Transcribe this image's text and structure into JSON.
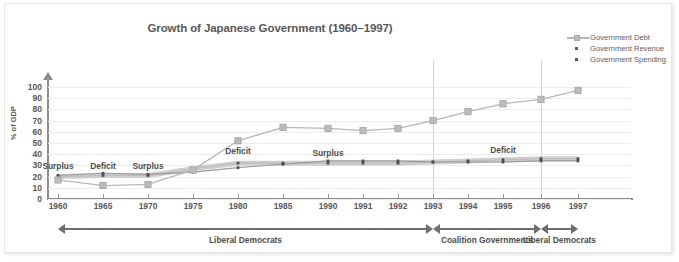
{
  "chart_data": {
    "type": "line",
    "title": "Growth of Japanese Government (1960–1997)",
    "xlabel": "",
    "ylabel": "% of GDP",
    "ylim": [
      0,
      100
    ],
    "ytick_labels": [
      "0",
      "10",
      "20",
      "30",
      "40",
      "50",
      "60",
      "70",
      "80",
      "90",
      "100"
    ],
    "grid": true,
    "legend_position": "top-right",
    "categories": [
      "1960",
      "1965",
      "1970",
      "1975",
      "1980",
      "1985",
      "1990",
      "1991",
      "1992",
      "1993",
      "1994",
      "1995",
      "1996",
      "1997"
    ],
    "series": [
      {
        "name": "Government Debt",
        "color": "#b7b7b7",
        "marker": "square",
        "values": [
          17,
          12,
          13,
          26,
          52,
          64,
          63,
          61,
          63,
          70,
          78,
          85,
          89,
          97
        ]
      },
      {
        "name": "Government Revenue",
        "color": "#5a5a5a",
        "marker": "dot",
        "values": [
          21,
          23,
          22,
          24,
          28,
          31,
          34,
          34,
          34,
          33,
          33,
          33,
          34,
          34
        ]
      },
      {
        "name": "Government Spending",
        "color": "#5a5a5a",
        "marker": "dot",
        "values": [
          20,
          21,
          21,
          27,
          32,
          32,
          32,
          32,
          32,
          33,
          34,
          35,
          36,
          36
        ]
      }
    ],
    "annotations": [
      {
        "text": "Surplus",
        "at": "1960",
        "value": 29
      },
      {
        "text": "Deficit",
        "at": "1965",
        "value": 29
      },
      {
        "text": "Surplus",
        "at": "1970",
        "value": 29
      },
      {
        "text": "Deficit",
        "at": "1980",
        "value": 42
      },
      {
        "text": "Surplus",
        "at": "1990",
        "value": 40
      },
      {
        "text": "Deficit",
        "at": "1995",
        "value": 43
      }
    ],
    "era_brackets": [
      {
        "label": "Liberal Democrats",
        "from": "1960",
        "to": "1993"
      },
      {
        "label": "Coalition Governments",
        "from": "1993",
        "to": "1996"
      },
      {
        "label": "Liberal Democrats",
        "from": "1996",
        "to": "1997"
      }
    ],
    "vertical_dividers": [
      "1993",
      "1996"
    ]
  },
  "legend": {
    "items": [
      {
        "label": "Government Debt",
        "icon": "line-square-marker-icon"
      },
      {
        "label": "Government Revenue",
        "icon": "dot-marker-icon"
      },
      {
        "label": "Government Spending",
        "icon": "dot-marker-icon"
      }
    ]
  },
  "colors": {
    "debt": "#b7b7b7",
    "revenue": "#5a5a5a",
    "spending": "#5a5a5a",
    "axis": "#8d8d8d",
    "grid": "#ededed",
    "text": "#585858",
    "frame": "#e8e8e8"
  }
}
